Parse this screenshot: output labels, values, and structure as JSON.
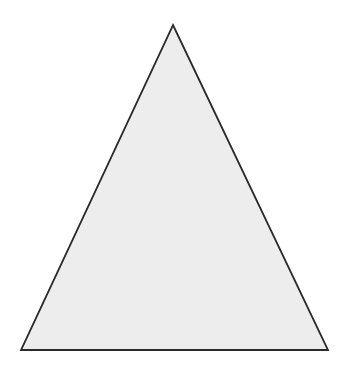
{
  "canvas": {
    "width": 348,
    "height": 366,
    "background_color": "#ffffff"
  },
  "figure": {
    "name": "triangle",
    "kind": "polygon",
    "sides": 3,
    "fill_color": "#ededed",
    "stroke_color": "#2a2a2a",
    "stroke_width": 1.8,
    "vertices": [
      {
        "label": "apex",
        "x": 173,
        "y": 25
      },
      {
        "label": "bottom-right",
        "x": 328,
        "y": 350
      },
      {
        "label": "bottom-left",
        "x": 21,
        "y": 350
      }
    ],
    "points_attr": "173,25 328,350 21,350"
  }
}
